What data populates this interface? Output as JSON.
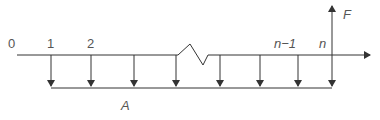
{
  "diagram": {
    "type": "cash-flow-timeline",
    "colors": {
      "line": "#333333",
      "text": "#555555",
      "background": "#ffffff"
    },
    "period_labels": {
      "p0": "0",
      "p1": "1",
      "p2": "2",
      "pn_minus_1": "n−1",
      "pn": "n"
    },
    "future_value_label": "F",
    "annuity_label": "A",
    "payment_count_shown": 8,
    "axis_break": true
  }
}
